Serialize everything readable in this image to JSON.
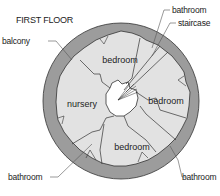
{
  "title": "FIRST FLOOR",
  "labels": {
    "balcony": "balcony",
    "bathroom_top": "bathroom",
    "staircase": "staircase",
    "bathroom_bottom_left": "bathroom",
    "bathroom_bottom_right": "bathroom"
  },
  "rooms": {
    "bedroom_top": "bedroom",
    "bedroom_right": "bedroom",
    "bedroom_bottom": "bedroom",
    "nursery": "nursery"
  },
  "colors": {
    "ring": "#9c9c9c",
    "floor": "#e2e2e2",
    "center": "#ffffff",
    "line": "#333333"
  }
}
